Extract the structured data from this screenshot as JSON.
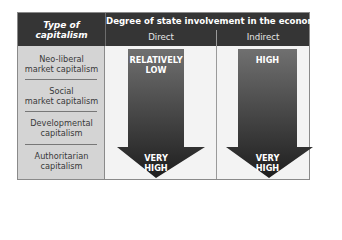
{
  "header": {
    "left_title_line1": "Type of",
    "left_title_line2": "capitalism",
    "main_title": "Degree of state involvement in the economy",
    "columns": [
      "Direct",
      "Indirect"
    ]
  },
  "rows": [
    {
      "line1": "Neo-liberal",
      "line2": "market capitalism"
    },
    {
      "line1": "Social",
      "line2": "market capitalism"
    },
    {
      "line1": "Developmental",
      "line2": "capitalism"
    },
    {
      "line1": "Authoritarian",
      "line2": "capitalism"
    }
  ],
  "arrows": [
    {
      "column": "Direct",
      "top_line1": "RELATIVELY",
      "top_line2": "LOW",
      "bottom_line1": "VERY",
      "bottom_line2": "HIGH"
    },
    {
      "column": "Indirect",
      "top_line1": "HIGH",
      "bottom_line1": "VERY",
      "bottom_line2": "HIGH"
    }
  ],
  "colors": {
    "header_bg": "#353535",
    "left_column_bg": "#d4d4d4",
    "body_bg": "#f3f3f3",
    "arrow_top": "#6e6e6e",
    "arrow_bottom": "#1f1f1f"
  }
}
